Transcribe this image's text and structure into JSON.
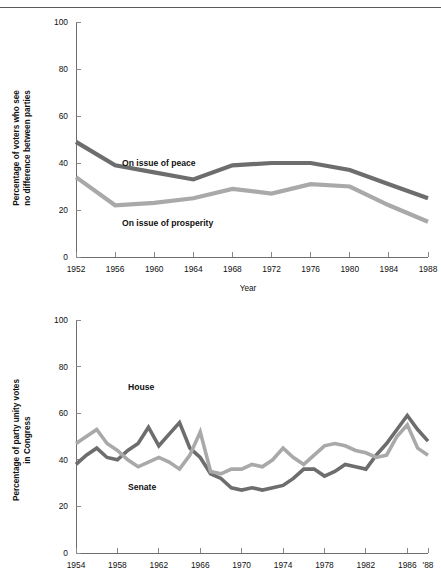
{
  "header": {
    "clipped_text": "Figure: Party difference and party unity"
  },
  "charts": {
    "top": {
      "ylabel_line1": "Percentage of voters who see",
      "ylabel_line2": "no difference between parties",
      "xlabel": "Year",
      "label_peace": "On issue of peace",
      "label_prosperity": "On issue of prosperity"
    },
    "bottom": {
      "ylabel_line1": "Percentage of party unity votes",
      "ylabel_line2": "in Congress",
      "label_house": "House",
      "label_senate": "Senate"
    }
  },
  "colors": {
    "dark_series": "#6d6d6d",
    "light_series": "#a9a9a9",
    "axis": "#6e6e6e",
    "text": "#111111",
    "background": "#ffffff"
  },
  "chart_data": [
    {
      "id": "voters-no-difference",
      "type": "line",
      "title": "",
      "xlabel": "Year",
      "ylabel": "Percentage of voters who see no difference between parties",
      "xlim": [
        1952,
        1988
      ],
      "ylim": [
        0,
        100
      ],
      "yticks": [
        0,
        20,
        40,
        60,
        80,
        100
      ],
      "xticks": [
        1952,
        1956,
        1960,
        1964,
        1968,
        1972,
        1976,
        1980,
        1984,
        1988
      ],
      "xtick_labels": [
        "1952",
        "1956",
        "1960",
        "1964",
        "1968",
        "1972",
        "1976",
        "1980",
        "1984",
        "1988"
      ],
      "grid": false,
      "legend": "inline-annotation",
      "x": [
        1952,
        1956,
        1960,
        1964,
        1968,
        1972,
        1976,
        1980,
        1984,
        1988
      ],
      "series": [
        {
          "name": "On issue of peace",
          "color": "#6d6d6d",
          "values": [
            49,
            39,
            36,
            33,
            39,
            40,
            40,
            37,
            31,
            25
          ]
        },
        {
          "name": "On issue of prosperity",
          "color": "#a9a9a9",
          "values": [
            34,
            22,
            23,
            25,
            29,
            27,
            31,
            30,
            22,
            15
          ]
        }
      ]
    },
    {
      "id": "party-unity-votes",
      "type": "line",
      "title": "",
      "xlabel": "",
      "ylabel": "Percentage of party unity votes in Congress",
      "xlim": [
        1954,
        1988
      ],
      "ylim": [
        0,
        100
      ],
      "yticks": [
        0,
        20,
        40,
        60,
        80,
        100
      ],
      "xticks": [
        1954,
        1958,
        1962,
        1966,
        1970,
        1974,
        1978,
        1982,
        1986,
        1988
      ],
      "xtick_labels": [
        "1954",
        "1958",
        "1962",
        "1966",
        "1970",
        "1974",
        "1978",
        "1982",
        "1986",
        "'88"
      ],
      "grid": false,
      "legend": "inline-annotation",
      "x": [
        1954,
        1955,
        1956,
        1957,
        1958,
        1959,
        1960,
        1961,
        1962,
        1963,
        1964,
        1965,
        1966,
        1967,
        1968,
        1969,
        1970,
        1971,
        1972,
        1973,
        1974,
        1975,
        1976,
        1977,
        1978,
        1979,
        1980,
        1981,
        1982,
        1983,
        1984,
        1985,
        1986,
        1987,
        1988
      ],
      "series": [
        {
          "name": "House",
          "color": "#6d6d6d",
          "values": [
            38,
            42,
            45,
            41,
            40,
            44,
            47,
            54,
            46,
            51,
            56,
            45,
            41,
            34,
            32,
            28,
            27,
            28,
            27,
            28,
            29,
            32,
            36,
            36,
            33,
            35,
            38,
            37,
            36,
            42,
            47,
            53,
            59,
            53,
            48
          ]
        },
        {
          "name": "Senate",
          "color": "#a9a9a9",
          "values": [
            47,
            50,
            53,
            47,
            44,
            40,
            37,
            39,
            41,
            39,
            36,
            42,
            52,
            35,
            34,
            36,
            36,
            38,
            37,
            40,
            45,
            41,
            38,
            42,
            46,
            47,
            46,
            44,
            43,
            41,
            42,
            50,
            55,
            45,
            42
          ]
        }
      ]
    }
  ]
}
